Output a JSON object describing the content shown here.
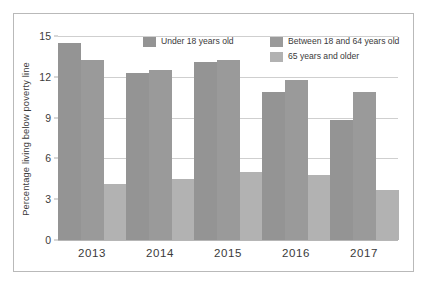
{
  "chart_data": {
    "type": "bar",
    "title": "",
    "subtitle": "",
    "xlabel": "",
    "ylabel": "Percentage living below poverty line",
    "categories": [
      "2013",
      "2014",
      "2015",
      "2016",
      "2017"
    ],
    "series": [
      {
        "name": "Under 18 years old",
        "color": "#949494",
        "values": [
          14.5,
          12.3,
          13.1,
          10.9,
          8.8
        ]
      },
      {
        "name": "Between 18 and 64 years old",
        "color": "#9a9a9a",
        "values": [
          13.2,
          12.5,
          13.2,
          11.8,
          10.9
        ]
      },
      {
        "name": "65 years and older",
        "color": "#b2b2b2",
        "values": [
          4.1,
          4.5,
          5.0,
          4.8,
          3.7
        ]
      }
    ],
    "ylim": [
      0,
      15
    ],
    "yticks": [
      0,
      3,
      6,
      9,
      12,
      15
    ],
    "ytick_labels": [
      "0",
      "3",
      "6",
      "9",
      "12",
      "15"
    ],
    "grid": true,
    "legend_position": "top-right",
    "bar_group_layout": "grouped-adjacent"
  },
  "figure": {
    "background_color": "#ffffff",
    "frame_color": "#b9b9b9",
    "gridline_color": "#cfcfcf",
    "axis_color": "#b6b6b6",
    "text_color": "#3a3a3a"
  }
}
